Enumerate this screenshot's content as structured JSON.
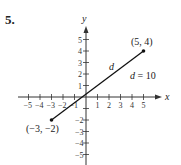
{
  "problem_number": "5.",
  "chart_data": {
    "type": "line",
    "title": "",
    "xlabel": "x",
    "ylabel": "y",
    "xlim": [
      -5,
      5
    ],
    "ylim": [
      -5,
      5
    ],
    "x_ticks": [
      "-5",
      "-4",
      "-3",
      "-2",
      "-1",
      "1",
      "2",
      "3",
      "4",
      "5"
    ],
    "y_ticks": [
      "5",
      "4",
      "3",
      "2",
      "1",
      "-2",
      "-3",
      "-4",
      "-5"
    ],
    "grid": false,
    "series": [
      {
        "name": "segment",
        "x": [
          -3,
          5
        ],
        "y": [
          -2,
          4
        ]
      }
    ],
    "points": [
      {
        "label": "(5, 4)",
        "x": 5,
        "y": 4
      },
      {
        "label": "(−3, −2)",
        "x": -3,
        "y": -2
      }
    ],
    "annotations": [
      {
        "text": "d",
        "x": 1.8,
        "y": 2.3
      },
      {
        "text": "d = 10",
        "x": 4.2,
        "y": 1.6
      }
    ]
  },
  "labels": {
    "x_axis": "x",
    "y_axis": "y",
    "segment_label": "d",
    "distance_label": "d = 10",
    "point_a": "(5, 4)",
    "point_b": "(−3, −2)"
  }
}
